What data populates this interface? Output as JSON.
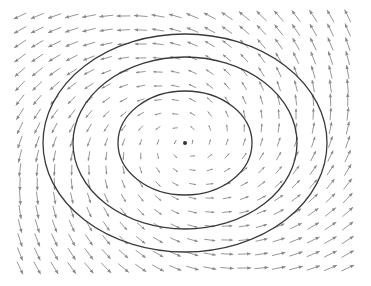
{
  "chart_data": {
    "type": "quiver",
    "title": "",
    "xlabel": "",
    "ylabel": "",
    "grid": false,
    "legend": null,
    "field": {
      "rotation": "counter-clockwise",
      "columns": 20,
      "rows": 19,
      "x_start_px": 20,
      "x_step_px": 17.25,
      "y_start_px": 16,
      "y_step_px": 14.0,
      "vector_formula": "u = -(y - cy)/ry^2 * k, v = (x - cx)/rx^2 * k (screen-space, counter-clockwise), with magnitude growing with distance from center",
      "arrow_color": "#8a8a8a"
    },
    "center_point": {
      "x_px": 185,
      "y_px": 143,
      "color": "#333333"
    },
    "contours": [
      {
        "name": "inner",
        "rx_px": 67,
        "ry_px": 52
      },
      {
        "name": "middle",
        "rx_px": 112,
        "ry_px": 86
      },
      {
        "name": "outer",
        "rx_px": 142,
        "ry_px": 109
      }
    ],
    "contour_color": "#3a3a3a"
  }
}
